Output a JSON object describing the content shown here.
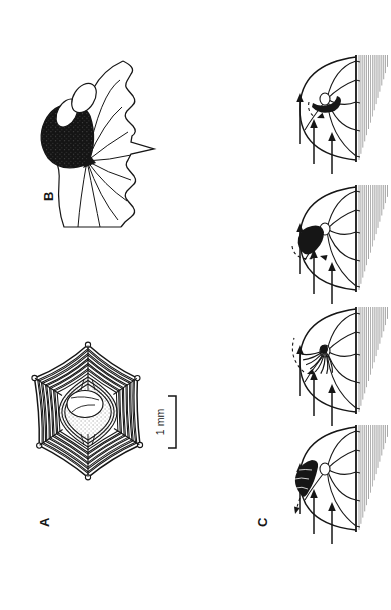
{
  "figure": {
    "kind": "scanned-line-drawing",
    "orientation": "rotated-90-counterclockwise",
    "colors": {
      "ink": "#161616",
      "paper": "#ffffff",
      "hatch": "#3a3a3a"
    },
    "panels": {
      "A": {
        "label": "A"
      },
      "B": {
        "label": "B"
      },
      "C": {
        "label": "C"
      }
    },
    "scale_bar": {
      "label": "1 mm"
    },
    "flow_sequence": {
      "steps": 4,
      "arrows_per_step": 3
    }
  }
}
